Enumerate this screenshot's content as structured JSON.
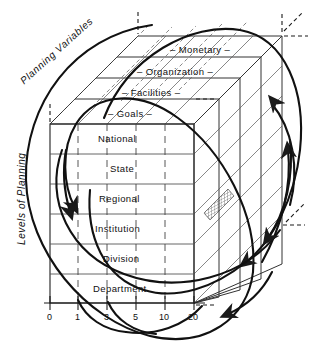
{
  "figure": {
    "type": "diagram",
    "axis_labels": {
      "left": "Levels of Planning",
      "depth": "Planning Variables"
    }
  },
  "depth_layers": [
    {
      "label": "– Monetary –"
    },
    {
      "label": "– Organization –"
    },
    {
      "label": "– Facilities –"
    },
    {
      "label": "– Goals –"
    }
  ],
  "levels": [
    {
      "label": "National"
    },
    {
      "label": "State"
    },
    {
      "label": "Regional"
    },
    {
      "label": "Institution"
    },
    {
      "label": "Division"
    },
    {
      "label": "Department"
    }
  ],
  "x_axis": {
    "ticks": [
      "0",
      "1",
      "3",
      "5",
      "10",
      "20"
    ]
  },
  "colors": {
    "stroke": "#1a1a1a",
    "grid": "#555555",
    "background": "#ffffff"
  }
}
